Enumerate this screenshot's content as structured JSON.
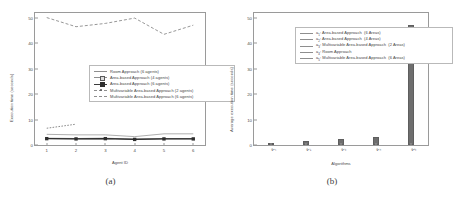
{
  "figure": {
    "panel_a": {
      "caption": "(a)",
      "chart": {
        "type": "line",
        "title": "",
        "xlabel": "Agent ID",
        "ylabel": "Execution time (seconds)",
        "xlim": [
          0.6,
          6.4
        ],
        "ylim": [
          0,
          52
        ],
        "xticks": [
          "1",
          "2",
          "3",
          "4",
          "5",
          "6"
        ],
        "yticks": [
          "0",
          "10",
          "20",
          "30",
          "40",
          "50"
        ],
        "grid": false,
        "legend_position": "center",
        "x": [
          1,
          2,
          3,
          4,
          5,
          6
        ],
        "series": [
          {
            "name": "Room Approach (6 agents)",
            "label": "Room Approach (6 agents)",
            "style": "solid-thin",
            "color": "#8e8e8e",
            "values": [
              4.2,
              4.0,
              4.0,
              3.3,
              4.4,
              4.4
            ]
          },
          {
            "name": "Area-based Approach (4 agents)",
            "label": "Area-based Approach (4 agents)",
            "style": "solid-open-square",
            "color": "#7a7a7a",
            "values": [
              2.6,
              2.5,
              2.6,
              2.3,
              2.5,
              2.5
            ]
          },
          {
            "name": "Area-based Approach (6 agents)",
            "label": "Area-based Approach (6 agents)",
            "style": "solid-filled-square",
            "color": "#2e2e2e",
            "values": [
              2.5,
              2.4,
              2.5,
              2.2,
              2.4,
              2.4
            ]
          },
          {
            "name": "Multivariable Area-based Approach (2 agents)",
            "label": "Multivariable Area-based Approach (2 agents)",
            "style": "dashed-dot",
            "color": "#6a6a6a",
            "values": [
              6.6,
              8.2,
              null,
              null,
              null,
              null
            ]
          },
          {
            "name": "Multivariable Area-based Approach (6 agents)",
            "label": "Multivariable Area-based Approach (6 agents)",
            "style": "dashed",
            "color": "#8a8a8a",
            "values": [
              50.2,
              46.6,
              47.9,
              50.0,
              43.6,
              47.2
            ]
          }
        ]
      }
    },
    "panel_b": {
      "caption": "(b)",
      "chart": {
        "type": "bar",
        "title": "",
        "xlabel": "Algorithms",
        "ylabel": "Average execution time (seconds)",
        "ylim": [
          0,
          52
        ],
        "yticks": [
          "0",
          "10",
          "20",
          "30",
          "40",
          "50"
        ],
        "grid": false,
        "legend_position": "upper-left",
        "categories": [
          "a1",
          "a2",
          "a3",
          "a4",
          "a5"
        ],
        "category_labels": [
          "a",
          "a",
          "a",
          "a",
          "a"
        ],
        "category_subscripts": [
          "1",
          "2",
          "3",
          "4",
          "5"
        ],
        "values": [
          0.7,
          1.5,
          2.2,
          3.1,
          47.4
        ],
        "bar_color": "#6e6e6e",
        "legend": [
          {
            "key": "a",
            "sub": "1",
            "label": "Area-based Approach",
            "detail": "(6 Areas)"
          },
          {
            "key": "a",
            "sub": "2",
            "label": "Area-based Approach",
            "detail": "(4 Areas)"
          },
          {
            "key": "a",
            "sub": "3",
            "label": "Multivariable Area-based Approach",
            "detail": "(2 Areas)"
          },
          {
            "key": "a",
            "sub": "4",
            "label": "Room Approach",
            "detail": ""
          },
          {
            "key": "a",
            "sub": "5",
            "label": "Multivariable Area-based Approach",
            "detail": "(6 Areas)"
          }
        ]
      }
    }
  }
}
